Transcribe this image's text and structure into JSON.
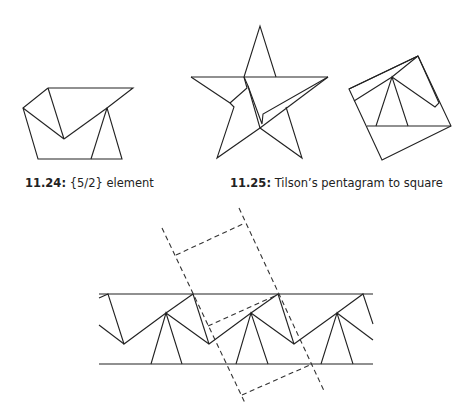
{
  "figures": [
    {
      "id": "11.24",
      "caption_number": "11.24:",
      "caption_text": " {5/2} element"
    },
    {
      "id": "11.25",
      "caption_number": "11.25:",
      "caption_text": " Tilson’s pentagram to square"
    },
    {
      "id": "strip",
      "caption_number": "",
      "caption_text": ""
    }
  ],
  "colors": {
    "line": "#222222",
    "background": "#ffffff"
  }
}
